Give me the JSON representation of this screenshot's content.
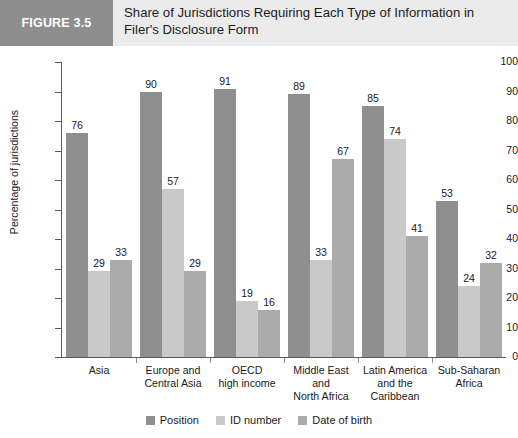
{
  "header": {
    "figure_tag": "FIGURE 3.5",
    "title": "Share of Jurisdictions Requiring Each Type of Information in Filer's Disclosure Form",
    "banner_color": "#ebebeb",
    "tag_color": "#8e8e8e"
  },
  "chart_data": {
    "type": "bar",
    "title": "Share of Jurisdictions Requiring Each Type of Information in Filer's Disclosure Form",
    "xlabel": "",
    "ylabel": "Percentage of jurisdictions",
    "ylim": [
      0,
      100
    ],
    "ytick_step": 10,
    "yticks": [
      0,
      10,
      20,
      30,
      40,
      50,
      60,
      70,
      80,
      90,
      100
    ],
    "grid": false,
    "legend_position": "bottom",
    "value_labels": true,
    "categories": [
      "Asia",
      "Europe and Central Asia",
      "OECD high income",
      "Middle East and North Africa",
      "Latin America and the Caribbean",
      "Sub-Saharan Africa"
    ],
    "category_lines": [
      [
        "Asia"
      ],
      [
        "Europe and",
        "Central Asia"
      ],
      [
        "OECD",
        "high income"
      ],
      [
        "Middle East",
        "and",
        "North Africa"
      ],
      [
        "Latin America",
        "and the",
        "Caribbean"
      ],
      [
        "Sub-Saharan",
        "Africa"
      ]
    ],
    "series": [
      {
        "name": "Position",
        "color": "#8f8f8f",
        "values": [
          76,
          90,
          91,
          89,
          85,
          53
        ]
      },
      {
        "name": "ID number",
        "color": "#c9c9c9",
        "values": [
          29,
          57,
          19,
          33,
          74,
          24
        ]
      },
      {
        "name": "Date of birth",
        "color": "#ababab",
        "values": [
          33,
          29,
          16,
          67,
          41,
          32
        ]
      }
    ]
  }
}
